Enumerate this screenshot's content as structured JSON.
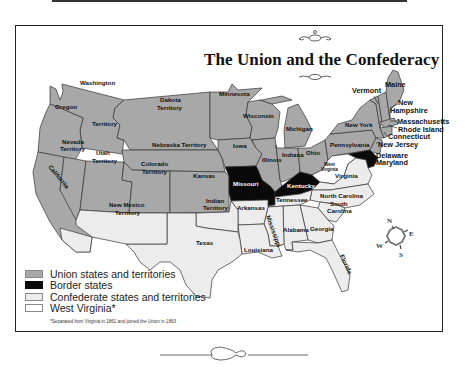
{
  "title": "The Union and the Confederacy",
  "colors": {
    "union": "#a8a8a8",
    "border": "#0a0a0a",
    "confederate": "#ececec",
    "west_virginia": "#ffffff",
    "outline": "#333333"
  },
  "regions": {
    "union": [
      "Washington Territory",
      "Oregon",
      "California",
      "Nevada Territory",
      "Utah Territory",
      "Colorado Territory",
      "Dakota Territory",
      "Nebraska Territory",
      "Kansas",
      "Minnesota",
      "Iowa",
      "Wisconsin",
      "Illinois",
      "Michigan",
      "Indiana",
      "Ohio",
      "Pennsylvania",
      "New York",
      "Vermont",
      "New Hampshire",
      "Maine",
      "Massachusetts",
      "Rhode Island",
      "Connecticut",
      "New Jersey"
    ],
    "border": [
      "Missouri",
      "Kentucky",
      "Delaware",
      "Maryland"
    ],
    "confederate": [
      "New Mexico Territory",
      "Indian Territory",
      "Texas",
      "Arkansas",
      "Louisiana",
      "Mississippi",
      "Alabama",
      "Tennessee",
      "Georgia",
      "Florida",
      "South Carolina",
      "North Carolina",
      "Virginia"
    ],
    "west_virginia": [
      "West Virginia"
    ]
  },
  "labels": {
    "washington": "Washington",
    "washington_territory": "Territory",
    "oregon": "Oregon",
    "california": "California",
    "nevada_1": "Nevada",
    "nevada_2": "Territory",
    "utah_1": "Utah",
    "utah_2": "Territory",
    "colorado_1": "Colorado",
    "colorado_2": "Territory",
    "dakota_1": "Dakota",
    "dakota_2": "Territory",
    "nebraska": "Nebraska Territory",
    "kansas": "Kansas",
    "minnesota": "Minnesota",
    "iowa": "Iowa",
    "wisconsin": "Wisconsin",
    "illinois": "Illinois",
    "michigan": "Michigan",
    "indiana": "Indiana",
    "ohio": "Ohio",
    "pennsylvania": "Pennsylvania",
    "new_york": "New York",
    "vermont": "Vermont",
    "maine": "Maine",
    "new_hampshire_1": "New",
    "new_hampshire_2": "Hampshire",
    "massachusetts": "Massachusetts",
    "rhode_island": "Rhode Island",
    "connecticut": "Connecticut",
    "new_jersey": "New Jersey",
    "delaware": "Delaware",
    "maryland": "Maryland",
    "missouri": "Missouri",
    "kentucky": "Kentucky",
    "west_virginia_1": "West",
    "west_virginia_2": "Virginia",
    "virginia": "Virginia",
    "new_mexico_1": "New Mexico",
    "new_mexico_2": "Territory",
    "indian_1": "Indian",
    "indian_2": "Territory",
    "texas": "Texas",
    "arkansas": "Arkansas",
    "louisiana": "Louisiana",
    "mississippi": "Mississippi",
    "alabama": "Alabama",
    "tennessee": "Tennessee",
    "georgia": "Georgia",
    "florida": "Florida",
    "south_carolina_1": "South",
    "south_carolina_2": "Carolina",
    "north_carolina": "North Carolina"
  },
  "compass": {
    "n": "N",
    "e": "E",
    "s": "S",
    "w": "W"
  },
  "legend": [
    {
      "label": "Union states and territories",
      "color": "#a8a8a8"
    },
    {
      "label": "Border states",
      "color": "#0a0a0a"
    },
    {
      "label": "Confederate states and territories",
      "color": "#ececec"
    },
    {
      "label": "West Virginia*",
      "color": "#ffffff"
    }
  ],
  "footnote": "*Separated from Virginia in 1861 and joined the Union in 1863"
}
